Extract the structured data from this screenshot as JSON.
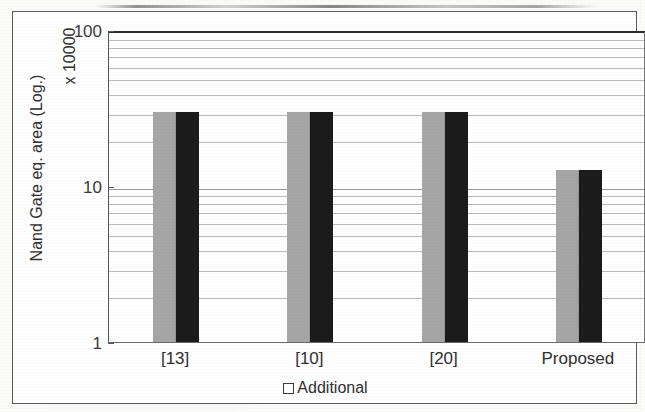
{
  "chart_data": {
    "type": "bar",
    "title": "",
    "subtitle": "",
    "xlabel": "",
    "ylabel": "Nand Gate eq. area (Log.)",
    "y_multiplier_label": "x 10000",
    "scale": "log",
    "grid": true,
    "ylim": [
      1,
      100
    ],
    "yticks": [
      1,
      10,
      100
    ],
    "ytick_labels": [
      "1",
      "10",
      "100"
    ],
    "categories": [
      "[13]",
      "[10]",
      "[20]",
      "Proposed"
    ],
    "series": [
      {
        "name": "Base",
        "color": "#a6a6a6",
        "values": [
          30,
          30,
          30,
          12.6
        ]
      },
      {
        "name": "Additional",
        "color": "#1c1c1c",
        "values": [
          30,
          30,
          30,
          12.6
        ]
      }
    ],
    "legend": {
      "position": "bottom",
      "entries": [
        {
          "label": "Additional",
          "marker": "open-square-icon",
          "color": "#ffffff",
          "border": "#3a3a3a"
        }
      ]
    },
    "colors": {
      "series_a": "#a6a6a6",
      "series_b": "#1c1c1c",
      "gridline": "#b9b9b9",
      "axis": "#555555",
      "text": "#2f2f2f",
      "frame": "#5b5b5b",
      "page": "#fbfbfa"
    }
  }
}
